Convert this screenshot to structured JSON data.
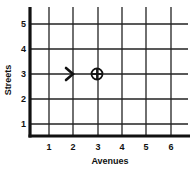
{
  "diagram": {
    "type": "coordinate-grid",
    "x_axis_label": "Avenues",
    "y_axis_label": "Streets",
    "x_ticks": [
      "1",
      "2",
      "3",
      "4",
      "5",
      "6"
    ],
    "y_ticks": [
      "1",
      "2",
      "3",
      "4",
      "5"
    ],
    "markers": [
      {
        "name": "arrow",
        "description": "right-pointing arrowhead",
        "x": 2,
        "y": 3
      },
      {
        "name": "target",
        "description": "circle with crosshair",
        "x": 3,
        "y": 3
      }
    ],
    "colors": {
      "line": "#111111",
      "background": "#ffffff"
    }
  }
}
